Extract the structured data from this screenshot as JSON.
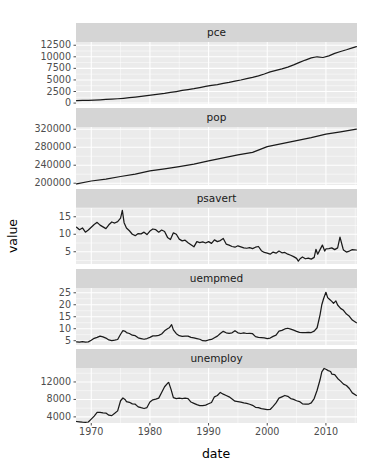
{
  "chart_data": {
    "type": "line",
    "title": "",
    "xlabel": "date",
    "ylabel": "value",
    "grid": true,
    "legend": "none",
    "facet_layout": "wrap-1-column-free-y",
    "x": {
      "label": "date",
      "ticks": [
        1970,
        1980,
        1990,
        2000,
        2010
      ],
      "tick_labels": [
        "1970",
        "1980",
        "1990",
        "2000",
        "2010"
      ],
      "range": [
        1967.4,
        2015.3
      ],
      "unit": "year"
    },
    "facets": [
      {
        "name": "pce",
        "ylim": [
          -200,
          13200
        ],
        "ticks": [
          0,
          2500,
          5000,
          7500,
          10000,
          12500
        ],
        "tick_labels": [
          "0",
          "2500",
          "5000",
          "7500",
          "10000",
          "12500"
        ],
        "series": [
          {
            "name": "pce",
            "x": [
              1967.5,
              1968.5,
              1969.5,
              1970.5,
              1971.5,
              1972.5,
              1973.5,
              1974.5,
              1975.5,
              1976.5,
              1977.5,
              1978.5,
              1979.5,
              1980.5,
              1981.5,
              1982.5,
              1983.5,
              1984.5,
              1985.5,
              1986.5,
              1987.5,
              1988.5,
              1989.5,
              1990.5,
              1991.5,
              1992.5,
              1993.5,
              1994.5,
              1995.5,
              1996.5,
              1997.5,
              1998.5,
              1999.5,
              2000.5,
              2001.5,
              2002.5,
              2003.5,
              2004.5,
              2005.5,
              2006.5,
              2007.5,
              2008.5,
              2009.5,
              2010.5,
              2011.5,
              2012.5,
              2013.5,
              2014.5,
              2015.2
            ],
            "y": [
              510,
              558,
              605,
              650,
              705,
              775,
              855,
              935,
              1035,
              1155,
              1280,
              1430,
              1590,
              1755,
              1940,
              2075,
              2290,
              2500,
              2720,
              2900,
              3100,
              3350,
              3600,
              3840,
              3980,
              4240,
              4480,
              4750,
              4990,
              5280,
              5550,
              5870,
              6280,
              6740,
              7050,
              7380,
              7760,
              8250,
              8800,
              9300,
              9750,
              10010,
              9850,
              10200,
              10730,
              11150,
              11520,
              11930,
              12200
            ]
          }
        ]
      },
      {
        "name": "pop",
        "ylim": [
          196000,
          325000
        ],
        "ticks": [
          200000,
          240000,
          280000,
          320000
        ],
        "tick_labels": [
          "200000",
          "240000",
          "280000",
          "320000"
        ],
        "series": [
          {
            "name": "pop",
            "x": [
              1967.5,
              1970,
              1972.5,
              1975,
              1977.5,
              1980,
              1982.5,
              1985,
              1987.5,
              1990,
              1992.5,
              1995,
              1997.5,
              2000,
              2002.5,
              2005,
              2007.5,
              2010,
              2012.5,
              2015.2
            ],
            "y": [
              198700,
              204900,
              209300,
              214900,
              220000,
              227200,
              232000,
              237000,
              242500,
              249600,
              256500,
              262800,
              268700,
              281500,
              288000,
              294900,
              301500,
              309300,
              314400,
              320400
            ]
          }
        ]
      },
      {
        "name": "psavert",
        "ylim": [
          1.5,
          17.5
        ],
        "ticks": [
          5,
          10,
          15
        ],
        "tick_labels": [
          "5",
          "10",
          "15"
        ],
        "series": [
          {
            "name": "psavert",
            "x": [
              1967.5,
              1968,
              1968.5,
              1969,
              1969.5,
              1970,
              1970.5,
              1971,
              1971.5,
              1972,
              1972.5,
              1973,
              1973.5,
              1974,
              1974.5,
              1975,
              1975.3,
              1975.6,
              1976,
              1976.5,
              1977,
              1977.5,
              1978,
              1978.5,
              1979,
              1979.5,
              1980,
              1980.5,
              1981,
              1981.5,
              1982,
              1982.5,
              1983,
              1983.5,
              1984,
              1984.5,
              1985,
              1985.5,
              1986,
              1986.5,
              1987,
              1987.5,
              1988,
              1988.5,
              1989,
              1989.5,
              1990,
              1990.5,
              1991,
              1991.5,
              1992,
              1992.5,
              1993,
              1993.5,
              1994,
              1994.5,
              1995,
              1995.5,
              1996,
              1996.5,
              1997,
              1997.5,
              1998,
              1998.5,
              1999,
              1999.5,
              2000,
              2000.5,
              2001,
              2001.5,
              2002,
              2002.5,
              2003,
              2003.5,
              2004,
              2004.5,
              2005,
              2005.3,
              2005.6,
              2006,
              2006.5,
              2007,
              2007.5,
              2008,
              2008.3,
              2008.6,
              2009,
              2009.4,
              2009.8,
              2010,
              2010.5,
              2011,
              2011.5,
              2012,
              2012.4,
              2012.9,
              2013,
              2013.5,
              2014,
              2014.5,
              2015.2
            ],
            "y": [
              12.0,
              11.3,
              11.8,
              10.6,
              11.2,
              12.0,
              12.8,
              13.4,
              12.6,
              12.1,
              11.6,
              12.7,
              13.5,
              13.2,
              13.6,
              14.6,
              16.8,
              13.3,
              11.8,
              11.0,
              10.0,
              9.6,
              10.2,
              10.1,
              10.6,
              9.9,
              10.9,
              11.5,
              11.3,
              10.6,
              11.2,
              10.8,
              9.1,
              8.5,
              10.4,
              10.0,
              8.6,
              8.1,
              8.3,
              7.6,
              7.0,
              6.4,
              7.9,
              7.6,
              7.8,
              7.5,
              7.9,
              7.4,
              8.4,
              7.9,
              8.2,
              8.8,
              7.2,
              6.9,
              6.5,
              6.3,
              6.7,
              6.4,
              6.1,
              6.0,
              6.2,
              5.9,
              6.3,
              6.5,
              5.3,
              4.8,
              4.6,
              4.3,
              4.9,
              4.6,
              5.2,
              4.7,
              4.8,
              4.3,
              4.0,
              3.6,
              3.1,
              2.3,
              3.0,
              3.5,
              3.0,
              3.2,
              2.9,
              3.4,
              5.7,
              4.3,
              5.6,
              6.9,
              5.2,
              5.8,
              5.9,
              6.1,
              5.6,
              6.1,
              9.2,
              6.0,
              5.5,
              4.9,
              5.2,
              5.6,
              5.5
            ]
          }
        ]
      },
      {
        "name": "uempmed",
        "ylim": [
          3.2,
          27.0
        ],
        "ticks": [
          5,
          10,
          15,
          20,
          25
        ],
        "tick_labels": [
          "5",
          "10",
          "15",
          "20",
          "25"
        ],
        "series": [
          {
            "name": "uempmed",
            "x": [
              1967.5,
              1968,
              1968.5,
              1969,
              1969.5,
              1970,
              1970.5,
              1971,
              1971.5,
              1972,
              1972.5,
              1973,
              1973.5,
              1974,
              1974.5,
              1975,
              1975.4,
              1975.8,
              1976,
              1976.5,
              1977,
              1977.5,
              1978,
              1978.5,
              1979,
              1979.5,
              1980,
              1980.5,
              1981,
              1981.5,
              1982,
              1982.5,
              1983,
              1983.3,
              1983.7,
              1984,
              1984.5,
              1985,
              1985.5,
              1986,
              1986.5,
              1987,
              1987.5,
              1988,
              1988.5,
              1989,
              1989.5,
              1990,
              1990.5,
              1991,
              1991.5,
              1992,
              1992.5,
              1993,
              1993.5,
              1994,
              1994.5,
              1995,
              1995.5,
              1996,
              1996.5,
              1997,
              1997.5,
              1998,
              1998.5,
              1999,
              1999.5,
              2000,
              2000.5,
              2001,
              2001.5,
              2002,
              2002.5,
              2003,
              2003.5,
              2004,
              2004.5,
              2005,
              2005.5,
              2006,
              2006.5,
              2007,
              2007.5,
              2008,
              2008.5,
              2009,
              2009.3,
              2009.6,
              2010,
              2010.3,
              2010.6,
              2011,
              2011.3,
              2011.7,
              2012,
              2012.5,
              2013,
              2013.5,
              2014,
              2014.5,
              2015.2
            ],
            "y": [
              4.5,
              4.4,
              4.6,
              4.4,
              4.5,
              5.2,
              6.0,
              6.4,
              6.9,
              6.6,
              6.1,
              5.3,
              5.0,
              5.2,
              5.5,
              7.7,
              9.2,
              8.9,
              8.4,
              8.0,
              7.3,
              7.1,
              6.2,
              5.9,
              5.6,
              5.9,
              6.4,
              7.0,
              7.0,
              7.2,
              7.8,
              9.1,
              10.0,
              10.4,
              11.7,
              9.5,
              7.9,
              7.1,
              6.8,
              6.9,
              6.9,
              6.4,
              6.2,
              5.9,
              5.6,
              5.0,
              4.9,
              5.3,
              5.5,
              6.2,
              6.9,
              8.0,
              8.9,
              8.3,
              8.1,
              8.3,
              9.2,
              8.3,
              8.0,
              8.3,
              8.0,
              8.1,
              7.9,
              6.7,
              6.4,
              6.3,
              6.2,
              5.9,
              6.1,
              6.8,
              7.3,
              9.0,
              9.3,
              9.9,
              10.2,
              9.8,
              9.4,
              8.9,
              8.5,
              8.4,
              8.4,
              8.5,
              8.4,
              9.0,
              10.4,
              15.8,
              20.0,
              22.5,
              25.2,
              23.0,
              22.3,
              21.4,
              20.6,
              21.6,
              19.9,
              18.5,
              17.7,
              16.1,
              15.2,
              13.6,
              12.5
            ]
          }
        ]
      },
      {
        "name": "unemploy",
        "ylim": [
          2600,
          15200
        ],
        "ticks": [
          4000,
          8000,
          12000
        ],
        "tick_labels": [
          "4000",
          "8000",
          "12000"
        ],
        "series": [
          {
            "name": "unemploy",
            "x": [
              1967.5,
              1968,
              1968.5,
              1969,
              1969.5,
              1970,
              1970.5,
              1971,
              1971.5,
              1972,
              1972.5,
              1973,
              1973.5,
              1974,
              1974.5,
              1975,
              1975.4,
              1975.8,
              1976,
              1976.5,
              1977,
              1977.5,
              1978,
              1978.5,
              1979,
              1979.5,
              1980,
              1980.5,
              1981,
              1981.5,
              1982,
              1982.5,
              1983,
              1983.2,
              1983.6,
              1984,
              1984.5,
              1985,
              1985.5,
              1986,
              1986.5,
              1987,
              1987.5,
              1988,
              1988.5,
              1989,
              1989.5,
              1990,
              1990.5,
              1991,
              1991.5,
              1992,
              1992.5,
              1993,
              1993.5,
              1994,
              1994.5,
              1995,
              1995.5,
              1996,
              1996.5,
              1997,
              1997.5,
              1998,
              1998.5,
              1999,
              1999.5,
              2000,
              2000.5,
              2001,
              2001.5,
              2002,
              2002.5,
              2003,
              2003.5,
              2004,
              2004.5,
              2005,
              2005.5,
              2006,
              2006.5,
              2007,
              2007.5,
              2008,
              2008.5,
              2009,
              2009.3,
              2009.7,
              2010,
              2010.4,
              2010.8,
              2011,
              2011.5,
              2012,
              2012.5,
              2013,
              2013.5,
              2014,
              2014.5,
              2015.2
            ],
            "y": [
              2944,
              2870,
              2790,
              2760,
              2830,
              3490,
              4180,
              5010,
              5040,
              4910,
              4870,
              4380,
              4290,
              4820,
              5380,
              7700,
              8330,
              7920,
              7500,
              7350,
              6980,
              6900,
              6300,
              6100,
              5920,
              6140,
              7400,
              7900,
              8050,
              8300,
              9600,
              10900,
              11700,
              11900,
              10300,
              8400,
              8200,
              8300,
              8200,
              8300,
              8200,
              7400,
              7100,
              6800,
              6600,
              6600,
              6700,
              7000,
              7300,
              8600,
              8900,
              9600,
              9200,
              8900,
              8600,
              8100,
              7600,
              7500,
              7400,
              7200,
              7100,
              6900,
              6650,
              6200,
              6100,
              5900,
              5800,
              5650,
              5700,
              6400,
              7200,
              8300,
              8600,
              8900,
              8700,
              8200,
              8000,
              7700,
              7500,
              7000,
              6900,
              6900,
              7200,
              8200,
              10100,
              12500,
              14300,
              15100,
              14900,
              14600,
              14400,
              13800,
              13700,
              12800,
              12200,
              11500,
              11200,
              10500,
              9500,
              8900,
              8600
            ]
          }
        ]
      }
    ]
  },
  "axis": {
    "y_title": "value",
    "x_title": "date"
  },
  "layout": {
    "plot_left": 76,
    "plot_right": 357,
    "panel_tops": [
      42,
      127,
      208,
      288,
      368
    ],
    "panel_heights": [
      62,
      58,
      56,
      57,
      55
    ],
    "strip_height": 19
  },
  "colors": {
    "panel_background": "#ebebeb",
    "strip_background": "#d5d5d5",
    "grid": "#ffffff",
    "line": "#1a1a1a",
    "text": "#4d4d4d",
    "title_text": "#000000",
    "page_background": "#ffffff"
  }
}
